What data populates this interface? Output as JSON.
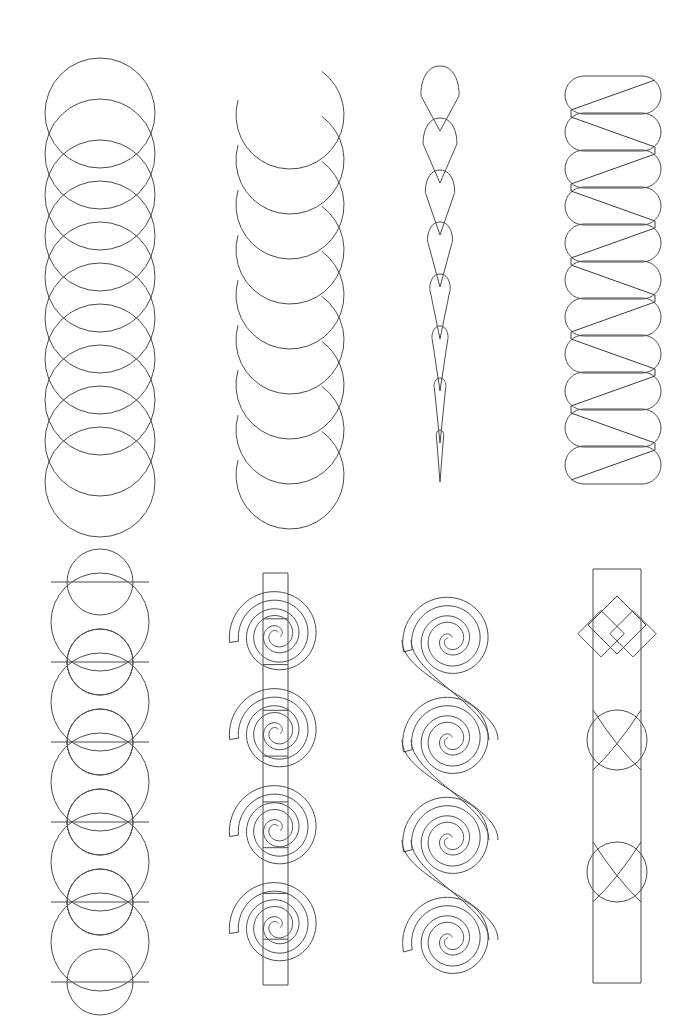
{
  "page": {
    "width": 697,
    "height": 1029,
    "background_color": "#ffffff",
    "ink_color": "#4a4a4a",
    "stroke_width": 1,
    "rows": 2,
    "columns": 4,
    "total_panels": 8
  },
  "panels": [
    {
      "index": 1,
      "row": 1,
      "column": 1,
      "name": "overlapping-circles-chain",
      "description": "Vertical chain of equal overlapping circles",
      "x": 45,
      "y": 58,
      "width": 110,
      "height": 410,
      "geometry": {
        "type": "circle-chain",
        "circle_count": 10,
        "radius": 55,
        "vertical_step": 41,
        "center_x": 100,
        "first_center_y": 113
      }
    },
    {
      "index": 2,
      "row": 1,
      "column": 2,
      "name": "c-arc-scallop-chain",
      "description": "Stacked open C-shaped arcs forming a scalloped vertical band",
      "x": 225,
      "y": 60,
      "width": 110,
      "height": 415,
      "geometry": {
        "type": "arc-chain",
        "arc_count": 9,
        "radius": 54,
        "vertical_step": 45,
        "center_x": 290,
        "first_center_y": 115,
        "arc_sweep_degrees": 250
      }
    },
    {
      "index": 3,
      "row": 1,
      "column": 3,
      "name": "tapering-teardrop-chain",
      "description": "Column of nested teardrop petals that narrow toward the bottom point",
      "x": 400,
      "y": 62,
      "width": 80,
      "height": 420,
      "geometry": {
        "type": "teardrop-chain",
        "petal_count": 8,
        "center_x": 440,
        "top_y": 66,
        "bottom_y": 482,
        "top_bulb_radius": 20,
        "taper": "linear"
      }
    },
    {
      "index": 4,
      "row": 1,
      "column": 4,
      "name": "zigzag-stadium-stack",
      "description": "Stack of horizontal rounded stadium shapes crossed by a continuous zigzag line",
      "x": 558,
      "y": 58,
      "width": 110,
      "height": 435,
      "geometry": {
        "type": "stadium-zigzag",
        "stadium_count": 11,
        "stadium_width": 96,
        "stadium_height": 38,
        "vertical_step": 37,
        "center_x": 613,
        "first_center_y": 95,
        "zigzag_segments": 11
      }
    },
    {
      "index": 5,
      "row": 2,
      "column": 1,
      "name": "guilloche-braid-circles",
      "description": "Interlaced circles of alternating size forming a braided ribbon",
      "x": 48,
      "y": 578,
      "width": 105,
      "height": 405,
      "geometry": {
        "type": "interlaced-circles",
        "large_circle_count": 5,
        "small_circle_count": 5,
        "large_radius": 49,
        "small_radius": 33,
        "vertical_step": 80,
        "center_x": 100,
        "first_center_y": 622
      }
    },
    {
      "index": 6,
      "row": 2,
      "column": 2,
      "name": "spirals-with-vertical-band",
      "description": "Four Archimedean spirals threaded by a narrow vertical ribbon band",
      "x": 225,
      "y": 572,
      "width": 115,
      "height": 415,
      "geometry": {
        "type": "spiral-column-with-band",
        "spiral_count": 4,
        "spiral_turns": 2.6,
        "spiral_outer_radius": 48,
        "vertical_step": 97,
        "center_x": 277,
        "first_center_y": 635,
        "band_left_x": 263,
        "band_right_x": 288,
        "band_top_y": 573,
        "band_bottom_y": 985,
        "band_rungs": 9
      }
    },
    {
      "index": 7,
      "row": 2,
      "column": 3,
      "name": "linked-spiral-chain",
      "description": "Continuous double-line band coiling into a vertical chain of linked spirals",
      "x": 390,
      "y": 578,
      "width": 120,
      "height": 400,
      "geometry": {
        "type": "linked-spirals",
        "spiral_count": 4,
        "spiral_turns": 2.4,
        "spiral_outer_radius": 48,
        "vertical_step": 100,
        "center_x": 450,
        "first_center_y": 640,
        "band_offset": 9
      }
    },
    {
      "index": 8,
      "row": 2,
      "column": 4,
      "name": "knotted-strap-band",
      "description": "Straight vertical strap interrupted by three interlacing knots: a square-diamond twist and two circular loops",
      "x": 558,
      "y": 568,
      "width": 110,
      "height": 415,
      "geometry": {
        "type": "knotted-strap",
        "strap_left_x": 593,
        "strap_right_x": 641,
        "strap_top_y": 569,
        "strap_bottom_y": 983,
        "knots": [
          {
            "kind": "diamond-cross-knot",
            "center_y": 625,
            "size": 58
          },
          {
            "kind": "circular-loop-knot",
            "center_y": 740,
            "radius": 30
          },
          {
            "kind": "circular-loop-knot",
            "center_y": 872,
            "radius": 30
          }
        ]
      }
    }
  ]
}
